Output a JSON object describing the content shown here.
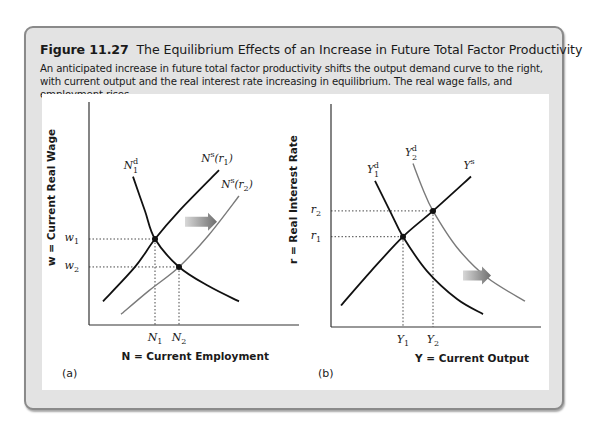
{
  "figure": {
    "number": "Figure 11.27",
    "title": "The Equilibrium Effects of an Increase in Future Total Factor Productivity",
    "caption": "An anticipated increase in future total factor productivity shifts the output demand curve to the right, with current output and the real interest rate increasing in equilibrium. The real wage falls, and employment rises."
  },
  "colors": {
    "frame_bg": "#e3e3e3",
    "frame_border": "#8a8a8a",
    "initial_curve": "#111111",
    "shifted_curve": "#7a7a7a",
    "arrow_start": "#d8d8d8",
    "arrow_end": "#6e6e6e"
  },
  "chart_data": [
    {
      "type": "line",
      "panel_label": "(a)",
      "xlabel": "N = Current Employment",
      "ylabel": "w = Current Real Wage",
      "xlim": [
        0,
        10
      ],
      "ylim": [
        0,
        10
      ],
      "grid": false,
      "x_ticks": [
        {
          "base": "N",
          "sub": "1",
          "value": 3.3
        },
        {
          "base": "N",
          "sub": "2",
          "value": 4.5
        }
      ],
      "y_ticks": [
        {
          "base": "w",
          "sub": "1",
          "value": 4.0
        },
        {
          "base": "w",
          "sub": "2",
          "value": 2.7
        }
      ],
      "series": [
        {
          "name": "N^s(r_1)",
          "label_base": "N",
          "label_sup": "s",
          "label_arg": "(r",
          "label_argsub": "1",
          "label_close": ")",
          "style": "initial",
          "points": [
            [
              0.7,
              1.1
            ],
            [
              2.3,
              2.7
            ],
            [
              3.3,
              4.0
            ],
            [
              4.5,
              5.3
            ],
            [
              6.5,
              7.2
            ]
          ]
        },
        {
          "name": "N_1^d",
          "label_base": "N",
          "label_sup": "d",
          "label_sub": "1",
          "style": "initial",
          "points": [
            [
              2.2,
              6.9
            ],
            [
              2.8,
              5.3
            ],
            [
              3.3,
              4.0
            ],
            [
              4.5,
              2.7
            ],
            [
              6.0,
              1.8
            ],
            [
              7.5,
              1.1
            ]
          ]
        },
        {
          "name": "N^s(r_2)",
          "label_base": "N",
          "label_sup": "s",
          "label_arg": "(r",
          "label_argsub": "2",
          "label_close": ")",
          "style": "shifted",
          "points": [
            [
              1.6,
              0.5
            ],
            [
              3.0,
              1.6
            ],
            [
              4.5,
              2.7
            ],
            [
              6.0,
              4.2
            ],
            [
              7.5,
              6.0
            ]
          ]
        }
      ],
      "equilibria": [
        {
          "x": 3.3,
          "y": 4.0
        },
        {
          "x": 4.5,
          "y": 2.7
        }
      ],
      "annotations": [
        {
          "type": "shift-arrow",
          "direction": "right",
          "from": [
            4.8,
            4.8
          ],
          "to": [
            6.4,
            4.8
          ]
        }
      ]
    },
    {
      "type": "line",
      "panel_label": "(b)",
      "xlabel": "Y = Current Output",
      "ylabel": "r = Real Interest Rate",
      "xlim": [
        0,
        10
      ],
      "ylim": [
        0,
        10
      ],
      "grid": false,
      "x_ticks": [
        {
          "base": "Y",
          "sub": "1",
          "value": 3.6
        },
        {
          "base": "Y",
          "sub": "2",
          "value": 5.1
        }
      ],
      "y_ticks": [
        {
          "base": "r",
          "sub": "2",
          "value": 5.4
        },
        {
          "base": "r",
          "sub": "1",
          "value": 4.2
        }
      ],
      "series": [
        {
          "name": "Y_1^d",
          "label_base": "Y",
          "label_sup": "d",
          "label_sub": "1",
          "style": "initial",
          "points": [
            [
              2.2,
              6.8
            ],
            [
              3.0,
              5.3
            ],
            [
              3.6,
              4.2
            ],
            [
              4.8,
              2.6
            ],
            [
              6.3,
              1.3
            ],
            [
              7.6,
              0.6
            ]
          ]
        },
        {
          "name": "Y_2^d",
          "label_base": "Y",
          "label_sup": "d",
          "label_sub": "2",
          "style": "shifted",
          "points": [
            [
              4.1,
              7.6
            ],
            [
              4.6,
              6.4
            ],
            [
              5.1,
              5.4
            ],
            [
              6.3,
              3.7
            ],
            [
              7.8,
              2.3
            ],
            [
              9.7,
              1.2
            ]
          ]
        },
        {
          "name": "Y^s",
          "label_base": "Y",
          "label_sup": "s",
          "style": "initial",
          "points": [
            [
              0.5,
              1.0
            ],
            [
              2.0,
              2.6
            ],
            [
              3.6,
              4.2
            ],
            [
              5.1,
              5.4
            ],
            [
              7.0,
              7.0
            ]
          ]
        }
      ],
      "equilibria": [
        {
          "x": 3.6,
          "y": 4.2
        },
        {
          "x": 5.1,
          "y": 5.4
        }
      ],
      "annotations": [
        {
          "type": "shift-arrow",
          "direction": "right",
          "from": [
            6.6,
            2.4
          ],
          "to": [
            8.0,
            2.4
          ]
        }
      ]
    }
  ]
}
